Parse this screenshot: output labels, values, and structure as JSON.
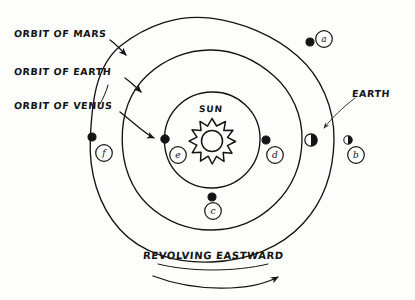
{
  "diagram": {
    "center_label": "SUN",
    "motion_label": "REVOLVING EASTWARD",
    "ink_color": "#141414",
    "paper_color": "#fdfdfc"
  },
  "callouts": [
    {
      "id": "orbit-mars",
      "text": "ORBIT OF MARS"
    },
    {
      "id": "orbit-earth",
      "text": "ORBIT OF EARTH"
    },
    {
      "id": "orbit-venus",
      "text": "ORBIT OF VENUS"
    },
    {
      "id": "earth",
      "text": "EARTH"
    }
  ],
  "orbits": [
    {
      "name": "venus",
      "label": "ORBIT OF VENUS",
      "radius": 48,
      "cx": 212,
      "cy": 140
    },
    {
      "name": "earth",
      "label": "ORBIT OF EARTH",
      "radius": 90,
      "cx": 212,
      "cy": 140
    },
    {
      "name": "mars",
      "label": "ORBIT OF MARS",
      "radius": 122,
      "cx": 212,
      "cy": 140
    }
  ],
  "markers": [
    {
      "id": "a",
      "letter": "a",
      "orbit": "mars",
      "x": 310,
      "y": 42,
      "fill": "solid",
      "letter_x": 319,
      "letter_y": 32
    },
    {
      "id": "b",
      "letter": "b",
      "orbit": "mars",
      "x": 348,
      "y": 140,
      "fill": "half",
      "letter_x": 352,
      "letter_y": 150
    },
    {
      "id": "c",
      "letter": "c",
      "orbit": "earth",
      "x": 212,
      "y": 197,
      "fill": "solid",
      "letter_x": 207,
      "letter_y": 203
    },
    {
      "id": "d",
      "letter": "d",
      "orbit": "earth",
      "x": 266,
      "y": 140,
      "fill": "solid",
      "letter_x": 270,
      "letter_y": 148
    },
    {
      "id": "e",
      "letter": "e",
      "orbit": "venus",
      "x": 165,
      "y": 140,
      "fill": "solid",
      "letter_x": 172,
      "letter_y": 148
    },
    {
      "id": "f",
      "letter": "f",
      "orbit": "mars",
      "x": 92,
      "y": 137,
      "fill": "solid",
      "letter_x": 99,
      "letter_y": 145
    },
    {
      "id": "earth",
      "letter": "",
      "orbit": "mars",
      "x": 311,
      "y": 140,
      "fill": "half",
      "letter_x": 0,
      "letter_y": 0
    }
  ],
  "sun": {
    "label": "SUN",
    "cx": 212,
    "cy": 140,
    "core_radius": 11,
    "ray_radius": 20,
    "ray_count": 11
  }
}
